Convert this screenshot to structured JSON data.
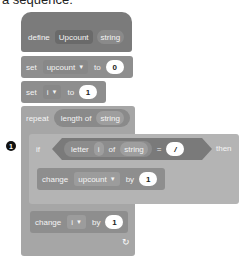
{
  "caption_partial": "a sequence:",
  "annotation_marker": "1",
  "define_block": {
    "keyword": "define",
    "name": "Upcount",
    "param": "string"
  },
  "set_upcount": {
    "keyword": "set",
    "variable": "upcount",
    "to_label": "to",
    "value": "0"
  },
  "set_i": {
    "keyword": "set",
    "variable": "i",
    "to_label": "to",
    "value": "1"
  },
  "repeat_block": {
    "keyword": "repeat",
    "reporter": "length of",
    "param": "string"
  },
  "if_block": {
    "keyword": "if",
    "letter_label": "letter",
    "index_var": "i",
    "of_label": "of",
    "string_param": "string",
    "equals": "=",
    "compare_value": "/",
    "then_label": "then"
  },
  "change_upcount": {
    "keyword": "change",
    "variable": "upcount",
    "by_label": "by",
    "value": "1"
  },
  "change_i": {
    "keyword": "change",
    "variable": "i",
    "by_label": "by",
    "value": "1"
  },
  "loop_arrow": "↻",
  "colors": {
    "define": "#7b7b7b",
    "variables": "#8e8e8e",
    "control": "#a6a6a6",
    "value_input": "#ffffff"
  }
}
